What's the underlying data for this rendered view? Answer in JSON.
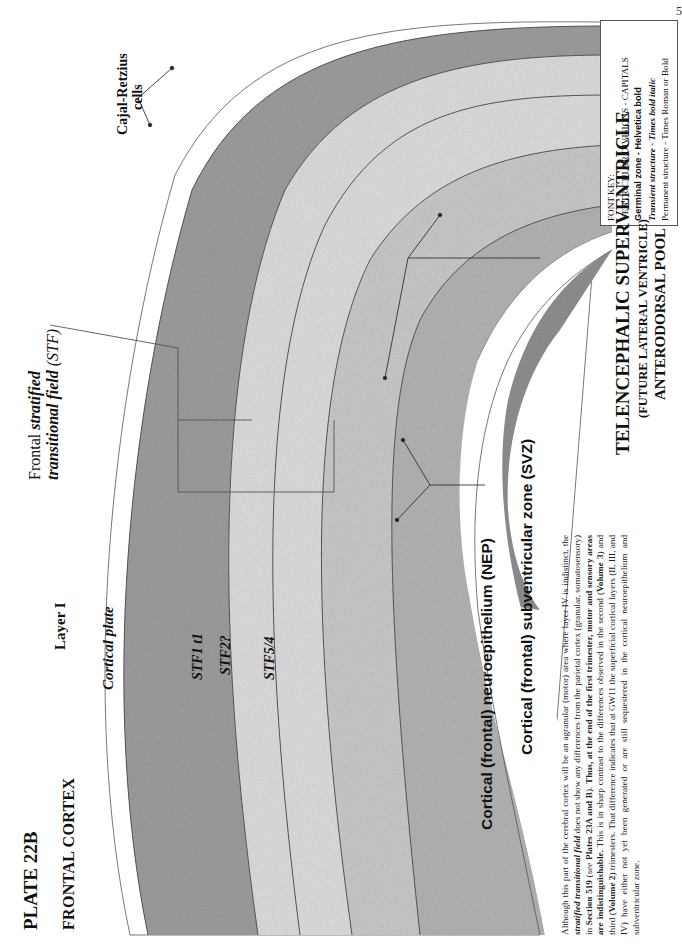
{
  "page": {
    "number": "5",
    "plate_title": "PLATE 22B",
    "plate_subtitle": "FRONTAL CORTEX"
  },
  "font_key": {
    "heading": "FONT KEY:",
    "lines": [
      "VENTRICULAR DIVISIONS - CAPITALS",
      "Germinal zone - Helvetica bold",
      "Transient structure - Times bold italic",
      "Permanent structure - Times Roman or Bold"
    ]
  },
  "labels": {
    "cajal_retzius": "Cajal-Retzius",
    "cajal_retzius_2": "cells",
    "frontal_stf_1": "Frontal",
    "frontal_stf_1b": "stratified",
    "frontal_stf_2": "transitional field",
    "frontal_stf_2b": " (STF)",
    "layer_i": "Layer I",
    "cortical_plate": "Cortical plate",
    "stf1": "STF1 t1",
    "stf2": "STF2?",
    "stf54": "STF5/4",
    "nep": "Cortical (frontal) neuroepithelium (NEP)",
    "svz": "Cortical (frontal) subventricular zone (SVZ)"
  },
  "ventricle": {
    "title": "TELENCEPHALIC SUPERVENTRICLE",
    "subtitle": "(FUTURE LATERAL VENTRICLE)",
    "pool": "ANTERODORSAL POOL"
  },
  "paragraph": {
    "s1": "Although this part of the cerebral cortex will be an agranular (motor) area where layer IV is indistinct, the ",
    "s1_em": "stratified transitional field",
    "s2": " does not show any differences from the parietal cortex (granular, somatosensory) in ",
    "s2_b": "Section 519",
    "s3": " (",
    "s3_i": "see",
    "s3b": " ",
    "s3_b": "Plates 23A and B",
    "s4": ").  ",
    "s4_b": "Thus, at the end of the first trimester, motor and sensory areas are indistinguishable.",
    "s5": "  This is in sharp contrast to the differences observed in the second (",
    "s5_b": "Volume 3",
    "s6": ") and third (",
    "s6_b": "Volume 2",
    "s7": ") trimesters.  That difference indicates that at GW11 the superficial cortical layers (II, III, and IV) have either not yet been generated or are still sequestered in the cortical neuroepithelium and subventricular zone."
  },
  "colors": {
    "cortical_plate": "#9a9a9a",
    "stf_light": "#dcdcdc",
    "svz": "#b5b5b5",
    "nep": "#8f8f8f",
    "line": "#444444"
  }
}
